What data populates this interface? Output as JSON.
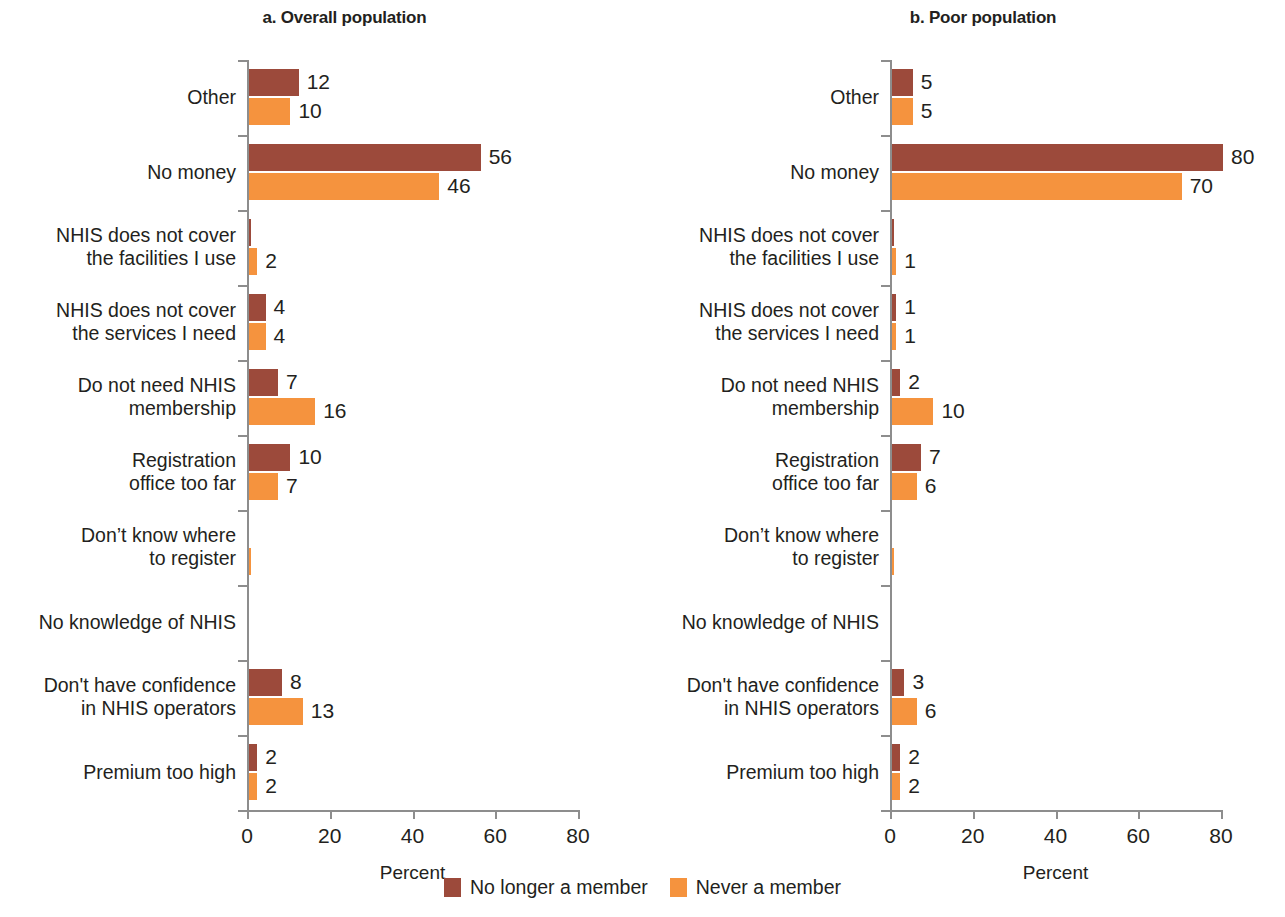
{
  "legend": {
    "items": [
      {
        "label": "No longer a member",
        "color": "#9c4a3b"
      },
      {
        "label": "Never a member",
        "color": "#f5933e"
      }
    ]
  },
  "panels": [
    {
      "id": "a",
      "title": "a. Overall population",
      "xlabel": "Percent"
    },
    {
      "id": "b",
      "title": "b. Poor population",
      "xlabel": "Percent"
    }
  ],
  "chart_data": {
    "type": "bar",
    "orientation": "horizontal",
    "xlabel": "Percent",
    "ylabel": "",
    "xlim": [
      0,
      80
    ],
    "xticks": [
      0,
      20,
      40,
      60,
      80
    ],
    "xticklabels": [
      "0",
      "20",
      "40",
      "60",
      "80"
    ],
    "grid": false,
    "legend_position": "bottom-center",
    "categories": [
      "Other",
      "No money",
      "NHIS does not cover\nthe facilities I use",
      "NHIS does not cover\nthe services I need",
      "Do not need NHIS\nmembership",
      "Registration\noffice too far",
      "Don’t know where\nto register",
      "No knowledge of NHIS",
      "Don't have confidence\nin NHIS operators",
      "Premium too high"
    ],
    "panels": [
      {
        "key": "a",
        "title": "a. Overall population",
        "series": [
          {
            "name": "No longer a member",
            "color": "#9c4a3b",
            "values": [
              12,
              56,
              0.3,
              4,
              7,
              10,
              0,
              0,
              8,
              2
            ],
            "labels": [
              "12",
              "56",
              "",
              "4",
              "7",
              "10",
              "",
              "",
              "8",
              "2"
            ]
          },
          {
            "name": "Never a member",
            "color": "#f5933e",
            "values": [
              10,
              46,
              2,
              4,
              16,
              7,
              0.5,
              0,
              13,
              2
            ],
            "labels": [
              "10",
              "46",
              "2",
              "4",
              "16",
              "7",
              "",
              "",
              "13",
              "2"
            ]
          }
        ]
      },
      {
        "key": "b",
        "title": "b. Poor population",
        "series": [
          {
            "name": "No longer a member",
            "color": "#9c4a3b",
            "values": [
              5,
              80,
              0.3,
              1,
              2,
              7,
              0,
              0,
              3,
              2
            ],
            "labels": [
              "5",
              "80",
              "",
              "1",
              "2",
              "7",
              "",
              "",
              "3",
              "2"
            ]
          },
          {
            "name": "Never a member",
            "color": "#f5933e",
            "values": [
              5,
              70,
              1,
              1,
              10,
              6,
              0.5,
              0,
              6,
              2
            ],
            "labels": [
              "5",
              "70",
              "1",
              "1",
              "10",
              "6",
              "",
              "",
              "6",
              "2"
            ]
          }
        ]
      }
    ]
  }
}
